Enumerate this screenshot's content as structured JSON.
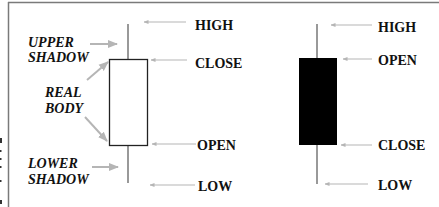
{
  "colors": {
    "frame": "#7a7a7a",
    "arrow": "#b5b5b5",
    "wick": "#555555",
    "white_body_fill": "#ffffff",
    "white_body_stroke": "#222222",
    "black_body_fill": "#000000",
    "text": "#111111"
  },
  "left_labels": {
    "upper_shadow": [
      "UPPER",
      "SHADOW"
    ],
    "real_body": [
      "REAL",
      "BODY"
    ],
    "lower_shadow": [
      "LOWER",
      "SHADOW"
    ]
  },
  "white_candle": {
    "name": "bullish",
    "labels": {
      "top": "HIGH",
      "body_top": "CLOSE",
      "body_bottom": "OPEN",
      "bottom": "LOW"
    },
    "geometry": {
      "wick_x": 128,
      "high_y": 24,
      "body_top_y": 59,
      "body_bottom_y": 145,
      "low_y": 183,
      "body_left": 109,
      "body_width": 38
    }
  },
  "black_candle": {
    "name": "bearish",
    "labels": {
      "top": "HIGH",
      "body_top": "OPEN",
      "body_bottom": "CLOSE",
      "bottom": "LOW"
    },
    "geometry": {
      "wick_x": 317,
      "high_y": 24,
      "body_top_y": 58,
      "body_bottom_y": 145,
      "low_y": 184,
      "body_left": 299,
      "body_width": 38
    }
  }
}
